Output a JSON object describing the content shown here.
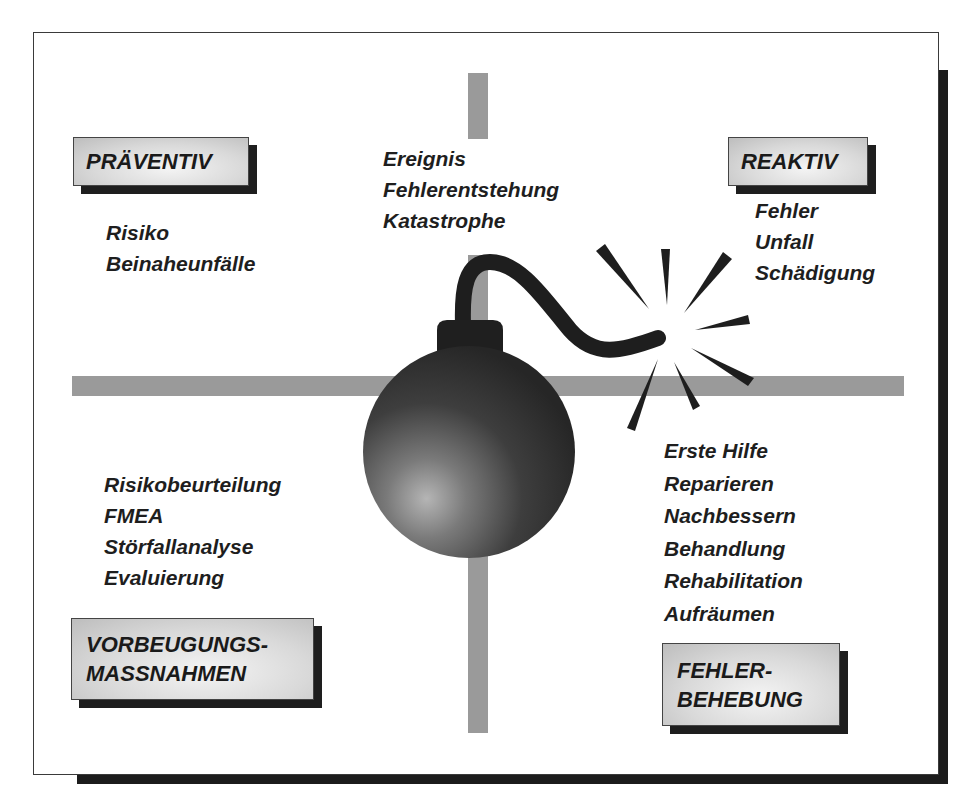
{
  "diagram": {
    "quadrants": {
      "top_left": {
        "label": "PRÄVENTIV",
        "items": [
          "Risiko",
          "Beinaheunfälle"
        ]
      },
      "top_center": {
        "items": [
          "Ereignis",
          "Fehlerentstehung",
          "Katastrophe"
        ]
      },
      "top_right": {
        "label": "REAKTIV",
        "items": [
          "Fehler",
          "Unfall",
          "Schädigung"
        ]
      },
      "bottom_left": {
        "label_line1": "VORBEUGUNGS-",
        "label_line2": "MASSNAHMEN",
        "items": [
          "Risikobeurteilung",
          "FMEA",
          "Störfallanalyse",
          "Evaluierung"
        ]
      },
      "bottom_right": {
        "label_line1": "FEHLER-",
        "label_line2": "BEHEBUNG",
        "items": [
          "Erste Hilfe",
          "Reparieren",
          "Nachbessern",
          "Behandlung",
          "Rehabilitation",
          "Aufräumen"
        ]
      }
    },
    "center_graphic": "bomb-icon",
    "colors": {
      "axis_bar": "#9a9a9a",
      "shadow": "#1c1c1c",
      "text": "#1e1e1e",
      "label_box": "#d9d9d9"
    }
  }
}
